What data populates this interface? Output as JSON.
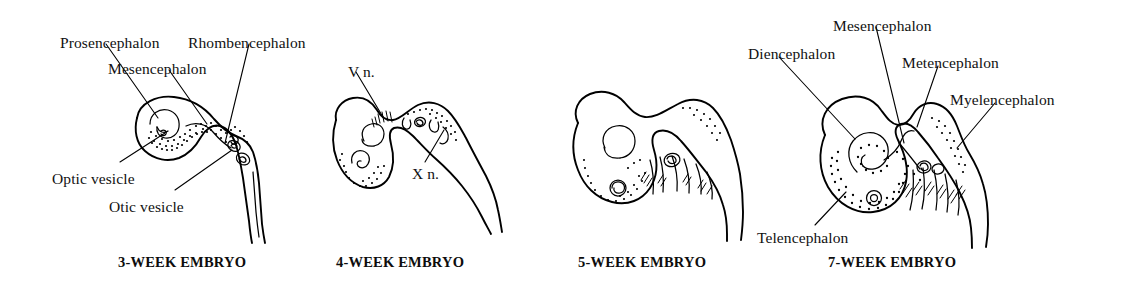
{
  "figure": {
    "background_color": "#ffffff",
    "ink_color": "#000000"
  },
  "panels": [
    {
      "id": "panel-3-week",
      "caption": "3-WEEK EMBRYO",
      "caption_x": 118,
      "caption_y": 254,
      "labels": [
        {
          "name": "prosencephalon",
          "text": "Prosencephalon",
          "x": 60,
          "y": 35
        },
        {
          "name": "rhombencephalon",
          "text": "Rhombencephalon",
          "x": 188,
          "y": 35
        },
        {
          "name": "mesencephalon",
          "text": "Mesencephalon",
          "x": 108,
          "y": 61
        },
        {
          "name": "optic-vesicle",
          "text": "Optic vesicle",
          "x": 52,
          "y": 171
        },
        {
          "name": "otic-vesicle",
          "text": "Otic vesicle",
          "x": 109,
          "y": 199
        }
      ]
    },
    {
      "id": "panel-4-week",
      "caption": "4-WEEK EMBRYO",
      "caption_x": 336,
      "caption_y": 254,
      "labels": [
        {
          "name": "trigeminal-nerve",
          "text": "V n.",
          "x": 348,
          "y": 64
        },
        {
          "name": "vagus-nerve",
          "text": "X n.",
          "x": 412,
          "y": 166
        }
      ]
    },
    {
      "id": "panel-5-week",
      "caption": "5-WEEK EMBRYO",
      "caption_x": 578,
      "caption_y": 254,
      "labels": []
    },
    {
      "id": "panel-7-week",
      "caption": "7-WEEK EMBRYO",
      "caption_x": 828,
      "caption_y": 254,
      "labels": [
        {
          "name": "mesencephalon",
          "text": "Mesencephalon",
          "x": 833,
          "y": 18
        },
        {
          "name": "diencephalon",
          "text": "Diencephalon",
          "x": 748,
          "y": 46
        },
        {
          "name": "metencephalon",
          "text": "Metencephalon",
          "x": 902,
          "y": 55
        },
        {
          "name": "myelencephalon",
          "text": "Myelencephalon",
          "x": 950,
          "y": 92
        },
        {
          "name": "telencephalon",
          "text": "Telencephalon",
          "x": 757,
          "y": 230
        }
      ]
    }
  ]
}
